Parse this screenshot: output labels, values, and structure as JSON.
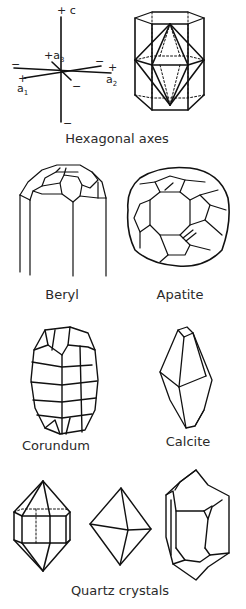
{
  "figure": {
    "panels": [
      {
        "id": "hexagonal-axes",
        "label": "Hexagonal axes",
        "axis_labels": {
          "c_plus": "+ c",
          "c_minus": "−",
          "a1_plus": "+",
          "a1_name": "a",
          "a1_sub": "1",
          "a1_minus": "−",
          "a2_plus": "+",
          "a2_name": "a",
          "a2_sub": "2",
          "a2_minus": "−",
          "a3_plus": "+a",
          "a3_sub": "3",
          "a3_minus": "−"
        }
      },
      {
        "id": "beryl",
        "label": "Beryl"
      },
      {
        "id": "apatite",
        "label": "Apatite"
      },
      {
        "id": "corundum",
        "label": "Corundum"
      },
      {
        "id": "calcite",
        "label": "Calcite"
      },
      {
        "id": "quartz",
        "label": "Quartz crystals"
      }
    ],
    "line_color": "#111111"
  }
}
